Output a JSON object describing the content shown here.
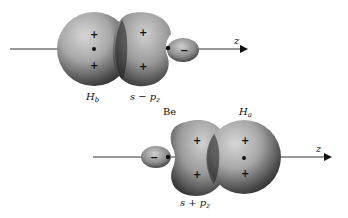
{
  "figure": {
    "top_panel": {
      "atom_left_label": "H",
      "atom_left_sub": "b",
      "hybrid_label": "s − p",
      "hybrid_sub": "z",
      "axis_label": "z",
      "hybrid_signs": [
        "+",
        "+"
      ],
      "sphere_signs": [
        "+",
        "+"
      ],
      "small_lobe_sign": "−"
    },
    "bottom_panel": {
      "atom_center_label": "Be",
      "atom_right_label": "H",
      "atom_right_sub": "a",
      "hybrid_label": "s + p",
      "hybrid_sub": "z",
      "axis_label": "z",
      "hybrid_signs": [
        "+",
        "+"
      ],
      "sphere_signs": [
        "+",
        "+"
      ],
      "small_lobe_sign": "−"
    }
  }
}
